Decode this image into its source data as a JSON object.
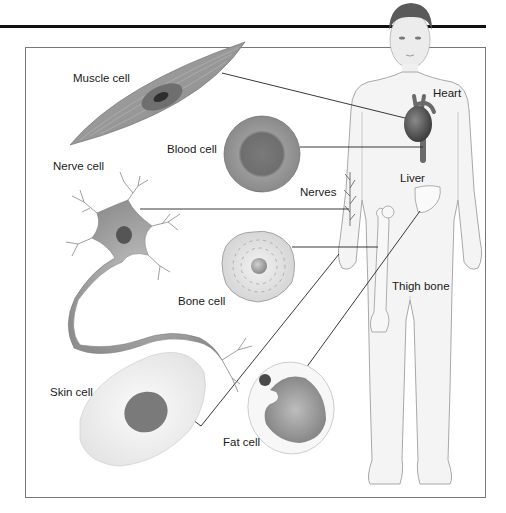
{
  "diagram": {
    "title": "",
    "colors": {
      "frame": "#777777",
      "top_rule": "#111111",
      "cell_gray": "#8c8c8c",
      "body_fill": "#f4f4f4",
      "body_outline": "#a8a8a8",
      "leader_line": "#222222"
    },
    "cells": [
      {
        "id": "muscle",
        "label": "Muscle cell",
        "connects_to": "Heart"
      },
      {
        "id": "blood",
        "label": "Blood cell",
        "connects_to": "Heart (blood vessel)"
      },
      {
        "id": "nerve",
        "label": "Nerve cell",
        "connects_to": "Nerves"
      },
      {
        "id": "bone",
        "label": "Bone cell",
        "connects_to": "Thigh bone"
      },
      {
        "id": "skin",
        "label": "Skin cell",
        "connects_to": "Hand (skin)"
      },
      {
        "id": "fat",
        "label": "Fat cell",
        "connects_to": "Liver"
      }
    ],
    "organs": [
      {
        "id": "heart",
        "label": "Heart"
      },
      {
        "id": "nerves",
        "label": "Nerves"
      },
      {
        "id": "liver",
        "label": "Liver"
      },
      {
        "id": "thigh-bone",
        "label": "Thigh bone"
      }
    ]
  }
}
